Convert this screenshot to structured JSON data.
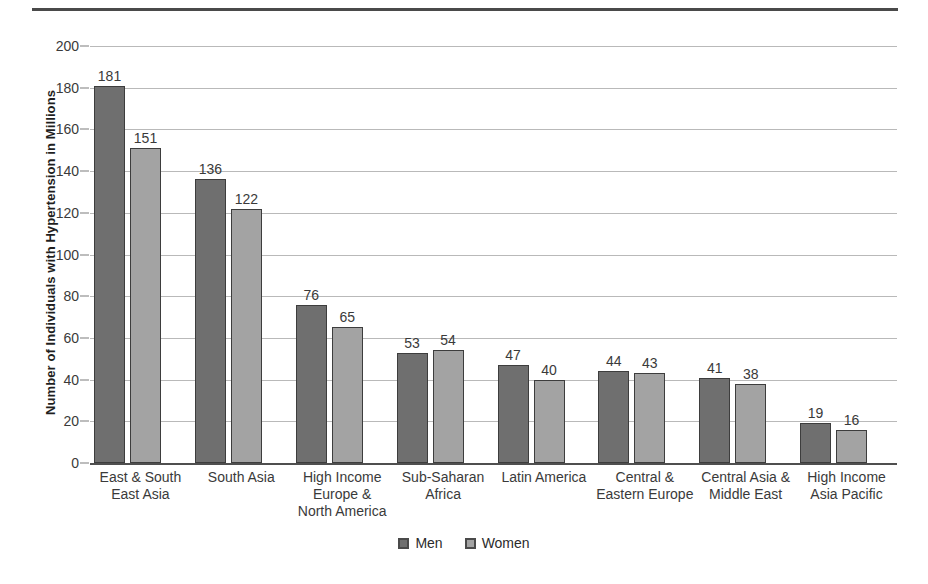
{
  "chart_data": {
    "type": "bar",
    "title": "",
    "xlabel": "",
    "ylabel": "Number of Individuals with Hypertension in Millions",
    "ylim": [
      0,
      200
    ],
    "ytick_step": 20,
    "yticks": [
      200,
      180,
      160,
      140,
      120,
      100,
      80,
      60,
      40,
      20,
      0
    ],
    "grid": true,
    "legend_position": "bottom-center",
    "categories": [
      "East & South East Asia",
      "South Asia",
      "High Income Europe & North America",
      "Sub-Saharan Africa",
      "Latin America",
      "Central & Eastern Europe",
      "Central Asia & Middle East",
      "High Income Asia Pacific"
    ],
    "category_lines": [
      [
        "East & South",
        "East Asia"
      ],
      [
        "South Asia"
      ],
      [
        "High Income",
        "Europe &",
        "North America"
      ],
      [
        "Sub-Saharan",
        "Africa"
      ],
      [
        "Latin America"
      ],
      [
        "Central &",
        "Eastern Europe"
      ],
      [
        "Central Asia &",
        "Middle East"
      ],
      [
        "High Income",
        "Asia Pacific"
      ]
    ],
    "series": [
      {
        "name": "Men",
        "color": "#6f6f6f",
        "values": [
          181,
          136,
          76,
          53,
          47,
          44,
          41,
          19
        ]
      },
      {
        "name": "Women",
        "color": "#a3a3a3",
        "values": [
          151,
          122,
          65,
          54,
          40,
          43,
          38,
          16
        ]
      }
    ]
  },
  "legend": {
    "items": [
      {
        "label": "Men",
        "color": "#6f6f6f"
      },
      {
        "label": "Women",
        "color": "#a3a3a3"
      }
    ]
  },
  "colors": {
    "men": "#6f6f6f",
    "women": "#a3a3a3",
    "gridline": "#b9b9b9",
    "axis": "#4f4f4f",
    "text": "#3a3a3a",
    "rule": "#4a4a4a",
    "background": "#ffffff"
  }
}
